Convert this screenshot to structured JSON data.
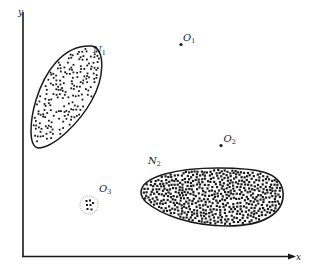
{
  "diagram": {
    "title": "",
    "colors": {
      "ink": "#1a1a1a",
      "background": "#ffffff",
      "dotted_circle": "#888888"
    },
    "axes": {
      "x_label": "x",
      "y_label": "y"
    },
    "clusters": [
      {
        "id": "N1",
        "label_main": "N",
        "label_sub": "1",
        "density": "medium",
        "dot_count": 190
      },
      {
        "id": "N2",
        "label_main": "N",
        "label_sub": "2",
        "density": "high",
        "dot_count": 520
      }
    ],
    "outliers": [
      {
        "id": "O1",
        "label_main": "O",
        "label_sub": "1",
        "type": "single-point"
      },
      {
        "id": "O2",
        "label_main": "O",
        "label_sub": "2",
        "type": "single-point"
      },
      {
        "id": "O3",
        "label_main": "O",
        "label_sub": "3",
        "type": "micro-cluster",
        "dot_count": 7
      }
    ]
  }
}
